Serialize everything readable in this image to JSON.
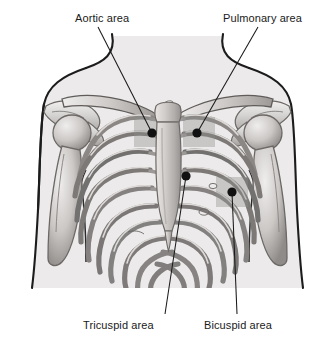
{
  "figure": {
    "type": "anatomical-diagram",
    "width": 335,
    "height": 341,
    "background_color": "#ffffff",
    "body_fill_color": "#eceaea",
    "bone_fill_color": "#d9d7d6",
    "bone_outline_color": "#5d5a58",
    "outline_color": "#1a1a1a",
    "patch_color": "#b8b6b4",
    "marker_color": "#111111",
    "leader_color": "#1a1a1a"
  },
  "labels": {
    "aortic": "Aortic area",
    "pulmonary": "Pulmonary area",
    "tricuspid": "Tricuspid area",
    "bicuspid": "Bicuspid area"
  },
  "markers": [
    {
      "name": "aortic",
      "label": "Aortic area",
      "x": 152,
      "y": 133
    },
    {
      "name": "pulmonary",
      "label": "Pulmonary area",
      "x": 197,
      "y": 133
    },
    {
      "name": "tricuspid",
      "label": "Tricuspid area",
      "x": 186,
      "y": 176
    },
    {
      "name": "bicuspid",
      "label": "Bicuspid area",
      "x": 232,
      "y": 192
    }
  ],
  "leader_lines": [
    {
      "name": "aortic",
      "x1": 98,
      "y1": 27,
      "x2": 152,
      "y2": 133
    },
    {
      "name": "pulmonary",
      "x1": 258,
      "y1": 27,
      "x2": 197,
      "y2": 133
    },
    {
      "name": "tricuspid",
      "x1": 165,
      "y1": 314,
      "x2": 186,
      "y2": 176
    },
    {
      "name": "bicuspid",
      "x1": 237,
      "y1": 314,
      "x2": 232,
      "y2": 192
    }
  ],
  "anatomy": {
    "parts": [
      "torso-outline",
      "neck",
      "left-shoulder",
      "right-shoulder",
      "left-clavicle",
      "right-clavicle",
      "left-scapula",
      "right-scapula",
      "left-humerus",
      "right-humerus",
      "sternum-manubrium",
      "sternum-body",
      "xiphoid-process",
      "ribs",
      "costal-cartilage"
    ],
    "rib_pair_count": 10
  }
}
